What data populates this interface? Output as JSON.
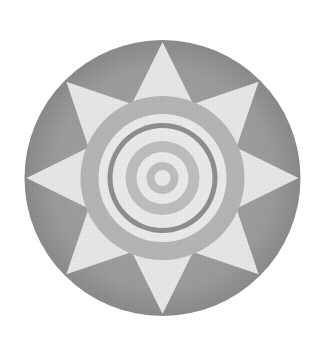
{
  "emblem": {
    "title": "sun-emblem",
    "center": [
      162.5,
      178
    ],
    "outer_radius": 138,
    "star": {
      "points": 8,
      "tip_radius": 136,
      "inner_radius": 80
    },
    "rings": [
      {
        "name": "gray-annulus",
        "r_outer": 82,
        "r_inner": 64
      },
      {
        "name": "light-band-1",
        "r_outer": 64,
        "r_inner": 55
      },
      {
        "name": "dark-thin-ring",
        "r_outer": 55,
        "r_inner": 50
      },
      {
        "name": "light-band-2",
        "r_outer": 50,
        "r_inner": 37
      },
      {
        "name": "gray-ring-2",
        "r_outer": 37,
        "r_inner": 26
      },
      {
        "name": "light-band-3",
        "r_outer": 26,
        "r_inner": 16
      },
      {
        "name": "gray-ring-3",
        "r_outer": 16,
        "r_inner": 8
      },
      {
        "name": "center-dot",
        "r_outer": 8,
        "r_inner": 0
      }
    ],
    "colors": {
      "background": "#ffffff",
      "disk_gray": "#9a9a9a",
      "disk_gray_edge": "#8a8a8a",
      "star_light": "#e6e6e6",
      "annulus_gray": "#b4b4b4",
      "ring_light": "#e9e9e9",
      "ring_dark": "#8e8e8e",
      "ring_gray": "#bdbdbd"
    }
  }
}
